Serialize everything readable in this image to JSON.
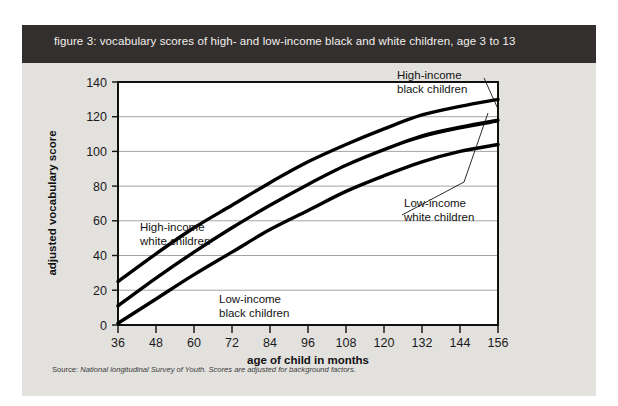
{
  "figure": {
    "title": "figure 3: vocabulary scores of high- and low-income black and white children, age 3 to 13",
    "source_label": "Source:",
    "source_body": "National longitudinal Survey of Youth. Scores are adjusted for background factors.",
    "background_color": "#e3e1de",
    "title_bar_color": "#332f2e",
    "title_text_color": "#f2f0ed"
  },
  "chart_data": {
    "type": "line",
    "title": "figure 3: vocabulary scores of high- and low-income black and white children, age 3 to 13",
    "xlabel": "age of child in months",
    "ylabel": "adjusted vocabulary score",
    "xlim": [
      36,
      156
    ],
    "ylim": [
      0,
      140
    ],
    "xticks": [
      36,
      48,
      60,
      72,
      84,
      96,
      108,
      120,
      132,
      144,
      156
    ],
    "yticks": [
      0,
      20,
      40,
      60,
      80,
      100,
      120,
      140
    ],
    "grid": "horizontal",
    "legend_position": "inline-annotations",
    "x": [
      36,
      48,
      60,
      72,
      84,
      96,
      108,
      120,
      132,
      144,
      156
    ],
    "series": [
      {
        "name": "High-income white children",
        "label": "High-income\nwhite children",
        "label_line1": "High-income",
        "label_line2": "white children",
        "color": "#000000",
        "width": 3.4,
        "values": [
          25,
          41,
          56,
          69,
          82,
          94,
          104,
          113,
          121,
          126,
          130
        ]
      },
      {
        "name": "High-income black children",
        "label": "High-income\nblack children",
        "label_line1": "High-income",
        "label_line2": "black children",
        "color": "#000000",
        "width": 3.4,
        "values": [
          11,
          27,
          42,
          56,
          69,
          81,
          92,
          101,
          109,
          114,
          118
        ]
      },
      {
        "name": "Low-income white children",
        "label": "Low-income\nwhite children",
        "label_line1": "Low-income",
        "label_line2": "white children",
        "color": "#000000",
        "width": 1.3,
        "values": [
          11,
          27,
          42,
          56,
          69,
          81,
          92,
          101,
          108,
          113,
          117
        ]
      },
      {
        "name": "Low-income black children",
        "label": "Low-income\nblack children",
        "label_line1": "Low-income",
        "label_line2": "black children",
        "color": "#000000",
        "width": 3.4,
        "values": [
          1,
          15,
          29,
          42,
          55,
          66,
          77,
          86,
          94,
          100,
          104
        ]
      }
    ],
    "annotations": [
      {
        "name": "high-income-black",
        "line1": "High-income",
        "line2": "black children",
        "x": 375,
        "y": 14
      },
      {
        "name": "low-income-white",
        "line1": "Low-income",
        "line2": "white children",
        "x": 382,
        "y": 142
      },
      {
        "name": "high-income-white",
        "line1": "High-income",
        "line2": "white children",
        "x": 118,
        "y": 166
      },
      {
        "name": "low-income-black",
        "line1": "Low-income",
        "line2": "black children",
        "x": 197,
        "y": 238
      }
    ]
  }
}
